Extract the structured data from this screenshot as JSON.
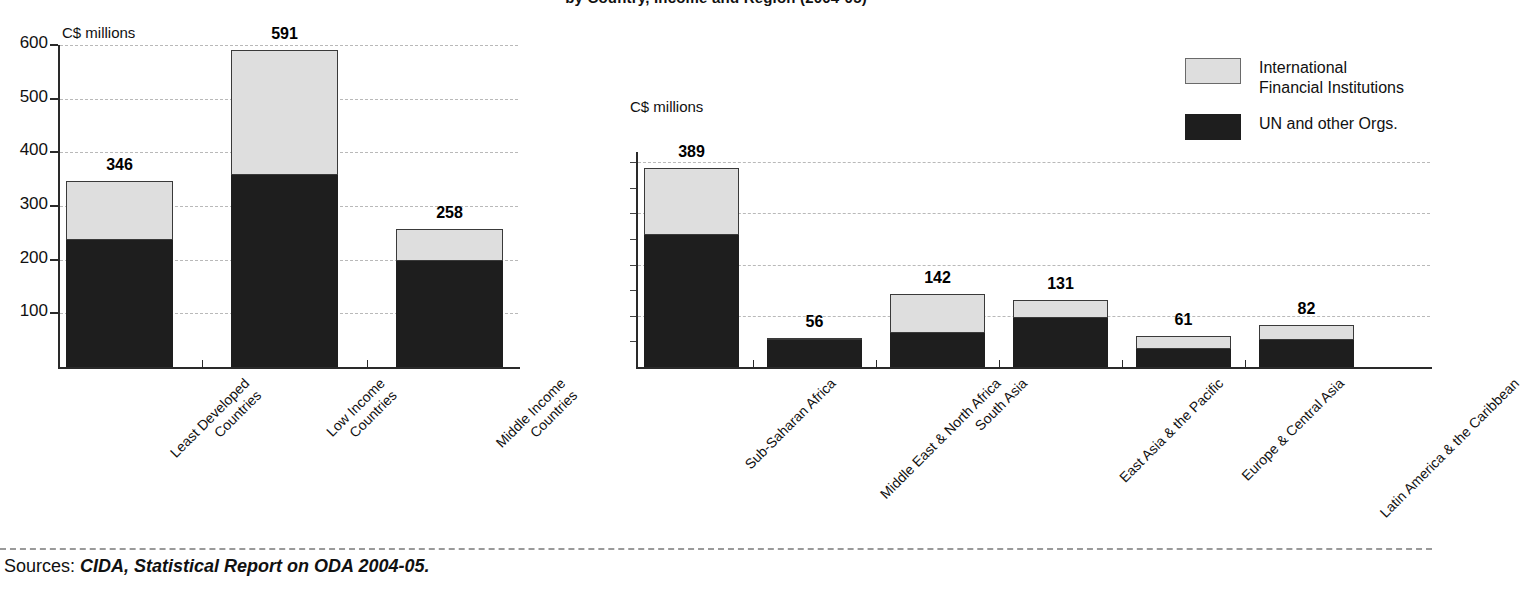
{
  "title": "by Country, Income and Region (2004-05)",
  "legend": {
    "position": "top-right",
    "items": [
      {
        "key": "ifi",
        "label": "International\nFinancial Institutions",
        "color": "#dedede"
      },
      {
        "key": "un",
        "label": "UN and other Orgs.",
        "color": "#1e1e1e"
      }
    ]
  },
  "footer": {
    "prefix": "Sources: ",
    "source": "CIDA, Statistical Report on ODA 2004-05."
  },
  "chart_data": [
    {
      "id": "income-chart",
      "type": "bar",
      "stacked": true,
      "title": "",
      "xlabel": "",
      "ylabel": "C$ millions",
      "ylim": [
        0,
        600
      ],
      "yticks": [
        100,
        200,
        300,
        400,
        500,
        600
      ],
      "ytick_labels": [
        "100",
        "200",
        "300",
        "400",
        "500",
        "600"
      ],
      "grid": true,
      "categories": [
        "Least Developed\nCountries",
        "Low Income\nCountries",
        "Middle Income\nCountries"
      ],
      "totals": [
        346,
        591,
        258
      ],
      "series": [
        {
          "name": "UN and other Orgs.",
          "key": "un",
          "color": "#1e1e1e",
          "values": [
            236,
            358,
            197
          ]
        },
        {
          "name": "International Financial Institutions",
          "key": "ifi",
          "color": "#dedede",
          "values": [
            110,
            233,
            61
          ]
        }
      ]
    },
    {
      "id": "region-chart",
      "type": "bar",
      "stacked": true,
      "title": "",
      "xlabel": "",
      "ylabel": "C$ millions",
      "ylim": [
        0,
        420
      ],
      "yticks": [],
      "ytick_labels": [],
      "grid": true,
      "categories": [
        "Sub-Saharan Africa",
        "Middle East & North Africa",
        "South Asia",
        "East Asia & the Pacific",
        "Europe & Central Asia",
        "Latin America & the Caribbean"
      ],
      "totals": [
        389,
        56,
        142,
        131,
        61,
        82
      ],
      "series": [
        {
          "name": "UN and other Orgs.",
          "key": "un",
          "color": "#1e1e1e",
          "values": [
            258,
            53,
            67,
            96,
            36,
            53
          ]
        },
        {
          "name": "International Financial Institutions",
          "key": "ifi",
          "color": "#dedede",
          "values": [
            131,
            3,
            75,
            35,
            25,
            29
          ]
        }
      ]
    }
  ]
}
